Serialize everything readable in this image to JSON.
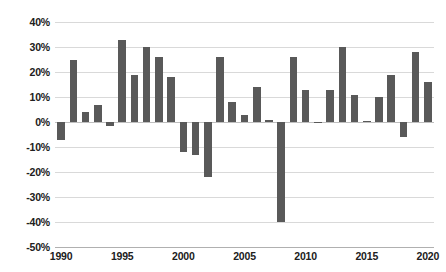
{
  "chart_data": {
    "type": "bar",
    "title": "",
    "subtitle": "",
    "xlabel": "",
    "ylabel": "",
    "grid": true,
    "legend": false,
    "legend_position": "none",
    "bar_color": "#595959",
    "gridline_color": "#d9d9d9",
    "ylim": [
      -50,
      40
    ],
    "ytick_values": [
      40,
      30,
      20,
      10,
      0,
      -10,
      -20,
      -30,
      -40,
      -50
    ],
    "ytick_labels": [
      "40%",
      "30%",
      "20%",
      "10%",
      "0%",
      "-10%",
      "-20%",
      "-30%",
      "-40%",
      "-50%"
    ],
    "xtick_labels": [
      "1990",
      "1995",
      "2000",
      "2005",
      "2010",
      "2015",
      "2020"
    ],
    "xtick_categories": [
      1990,
      1995,
      2000,
      2005,
      2010,
      2015,
      2020
    ],
    "categories": [
      "1990",
      "1991",
      "1992",
      "1993",
      "1994",
      "1995",
      "1996",
      "1997",
      "1998",
      "1999",
      "2000",
      "2001",
      "2002",
      "2003",
      "2004",
      "2005",
      "2006",
      "2007",
      "2008",
      "2009",
      "2010",
      "2011",
      "2012",
      "2013",
      "2014",
      "2015",
      "2016",
      "2017",
      "2018",
      "2019",
      "2020"
    ],
    "values": [
      -7,
      25,
      4,
      7,
      -1.5,
      33,
      19,
      30,
      26,
      18,
      -12,
      -13,
      -22,
      26,
      8,
      3,
      14,
      1,
      -40,
      26,
      13,
      -0.5,
      13,
      30,
      11,
      0.5,
      10,
      19,
      -6,
      28,
      16
    ]
  }
}
